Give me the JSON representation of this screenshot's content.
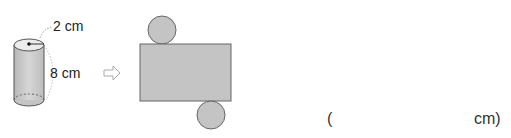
{
  "figure": {
    "radius_label": "2 cm",
    "height_label": "8 cm",
    "arrow": "right-arrow-icon"
  },
  "answer": {
    "open_paren": "(",
    "unit_close": "cm)"
  }
}
